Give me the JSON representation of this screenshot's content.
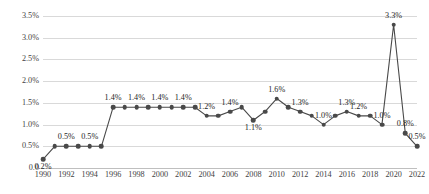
{
  "chart_data": {
    "type": "line",
    "title": "",
    "subtitle": "",
    "xlabel": "",
    "ylabel": "",
    "ylim": [
      0,
      3.5
    ],
    "ytick_labels": [
      "3.5%",
      "3.0%",
      "2.5%",
      "2.0%",
      "1.5%",
      "1.0%",
      "0.5%",
      "0.0"
    ],
    "ytick_values": [
      3.5,
      3.0,
      2.5,
      2.0,
      1.5,
      1.0,
      0.5,
      0.0
    ],
    "xtick_labels": [
      "1990",
      "1992",
      "1994",
      "1996",
      "1998",
      "2000",
      "2002",
      "2004",
      "2006",
      "2008",
      "2010",
      "2012",
      "2014",
      "2016",
      "2018",
      "2020",
      "2022"
    ],
    "xtick_values": [
      1990,
      1992,
      1994,
      1996,
      1998,
      2000,
      2002,
      2004,
      2006,
      2008,
      2010,
      2012,
      2014,
      2016,
      2018,
      2020,
      2022
    ],
    "grid": true,
    "legend": "none",
    "marker": "circle",
    "line_color": "#494949",
    "marker_color": "#494949",
    "grid_color": "#d9d9d9",
    "x": [
      1990,
      1991,
      1992,
      1993,
      1994,
      1995,
      1996,
      1997,
      1998,
      1999,
      2000,
      2001,
      2002,
      2003,
      2004,
      2005,
      2006,
      2007,
      2008,
      2009,
      2010,
      2011,
      2012,
      2013,
      2014,
      2015,
      2016,
      2017,
      2018,
      2019,
      2020,
      2021,
      2022
    ],
    "values": [
      0.2,
      0.5,
      0.5,
      0.5,
      0.5,
      0.5,
      1.4,
      1.4,
      1.4,
      1.4,
      1.4,
      1.4,
      1.4,
      1.4,
      1.2,
      1.2,
      1.3,
      1.4,
      1.1,
      1.3,
      1.6,
      1.4,
      1.3,
      1.2,
      1.0,
      1.2,
      1.3,
      1.2,
      1.2,
      1.0,
      3.3,
      0.8,
      0.5
    ],
    "point_labels": [
      {
        "x": 1990,
        "value": 0.2,
        "text": "0.2%",
        "pos": "below"
      },
      {
        "x": 1992,
        "value": 0.5,
        "text": "0.5%",
        "pos": "above"
      },
      {
        "x": 1994,
        "value": 0.5,
        "text": "0.5%",
        "pos": "above"
      },
      {
        "x": 1996,
        "value": 1.4,
        "text": "1.4%",
        "pos": "above"
      },
      {
        "x": 1998,
        "value": 1.4,
        "text": "1.4%",
        "pos": "above"
      },
      {
        "x": 2000,
        "value": 1.4,
        "text": "1.4%",
        "pos": "above"
      },
      {
        "x": 2002,
        "value": 1.4,
        "text": "1.4%",
        "pos": "above"
      },
      {
        "x": 2004,
        "value": 1.2,
        "text": "1.2%",
        "pos": "above"
      },
      {
        "x": 2006,
        "value": 1.3,
        "text": "1.4%",
        "pos": "above"
      },
      {
        "x": 2008,
        "value": 1.1,
        "text": "1.1%",
        "pos": "below"
      },
      {
        "x": 2010,
        "value": 1.6,
        "text": "1.6%",
        "pos": "above"
      },
      {
        "x": 2012,
        "value": 1.3,
        "text": "1.3%",
        "pos": "above"
      },
      {
        "x": 2014,
        "value": 1.0,
        "text": "1.0%",
        "pos": "above"
      },
      {
        "x": 2016,
        "value": 1.3,
        "text": "1.3%",
        "pos": "above"
      },
      {
        "x": 2017,
        "value": 1.2,
        "text": "1.2%",
        "pos": "above"
      },
      {
        "x": 2019,
        "value": 1.0,
        "text": "1.0%",
        "pos": "above"
      },
      {
        "x": 2020,
        "value": 3.3,
        "text": "3.3%",
        "pos": "above"
      },
      {
        "x": 2021,
        "value": 0.8,
        "text": "0.8%",
        "pos": "above"
      },
      {
        "x": 2022,
        "value": 0.5,
        "text": "0.5%",
        "pos": "above"
      }
    ]
  }
}
